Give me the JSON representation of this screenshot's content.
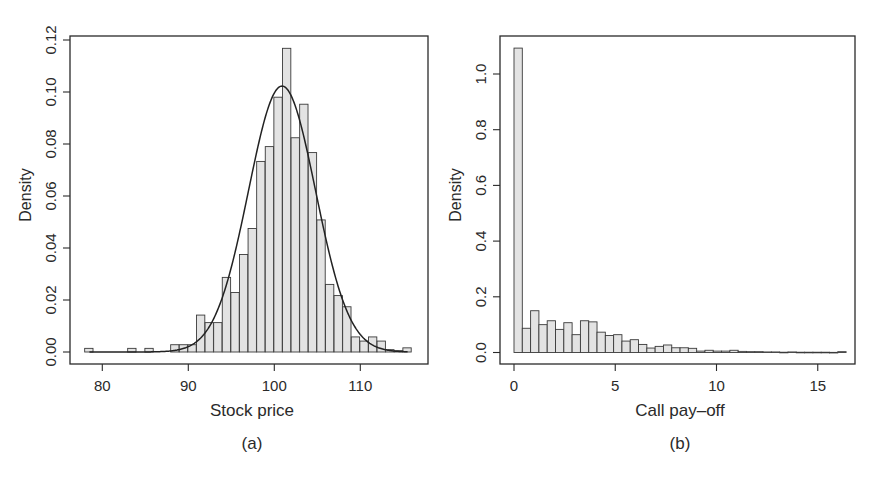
{
  "figure": {
    "panels": [
      {
        "id": "a",
        "caption": "(a)",
        "xlabel": "Stock price",
        "ylabel": "Density"
      },
      {
        "id": "b",
        "caption": "(b)",
        "xlabel": "Call pay–off",
        "ylabel": "Density"
      }
    ],
    "colors": {
      "bar_fill": "#e3e3e3",
      "bar_stroke": "#3a3a3a",
      "axis": "#2a2a2a",
      "curve": "#222222"
    }
  },
  "chart_data": [
    {
      "type": "bar",
      "subtype": "histogram_with_density_curve",
      "title": "",
      "caption": "(a)",
      "xlabel": "Stock price",
      "ylabel": "Density",
      "xlim": [
        76.5,
        117.3
      ],
      "ylim": [
        0,
        0.12
      ],
      "xticks": [
        80,
        90,
        100,
        110
      ],
      "yticks": [
        "0.00",
        "0.02",
        "0.04",
        "0.06",
        "0.08",
        "0.10",
        "0.12"
      ],
      "bin_width": 1,
      "bins_start": [
        78,
        83,
        85,
        88,
        89,
        90,
        91,
        92,
        93,
        94,
        95,
        96,
        97,
        98,
        99,
        100,
        101,
        102,
        103,
        104,
        105,
        106,
        107,
        108,
        109,
        110,
        111,
        112,
        113,
        114,
        115
      ],
      "values": [
        0.0014,
        0.0014,
        0.0014,
        0.0028,
        0.0028,
        0.0028,
        0.0142,
        0.0113,
        0.0113,
        0.0287,
        0.0229,
        0.0375,
        0.0475,
        0.0733,
        0.079,
        0.098,
        0.1168,
        0.0824,
        0.0953,
        0.0767,
        0.0508,
        0.026,
        0.0217,
        0.0174,
        0.0058,
        0.0042,
        0.0058,
        0.0042,
        0.0009,
        0.0005,
        0.0016
      ],
      "curve": {
        "type": "normal_density",
        "mean": 100.9,
        "sd": 3.9,
        "peak": 0.102
      },
      "grid": false,
      "legend": null
    },
    {
      "type": "bar",
      "subtype": "histogram",
      "title": "",
      "caption": "(b)",
      "xlabel": "Call pay–off",
      "ylabel": "Density",
      "xlim": [
        -0.7,
        16.9
      ],
      "ylim": [
        0,
        1.1
      ],
      "xticks": [
        0,
        5,
        10,
        15
      ],
      "yticks": [
        "0.0",
        "0.2",
        "0.4",
        "0.6",
        "0.8",
        "1.0"
      ],
      "bin_width": 0.41,
      "values": [
        1.093,
        0.087,
        0.15,
        0.1,
        0.114,
        0.083,
        0.107,
        0.064,
        0.114,
        0.11,
        0.073,
        0.061,
        0.064,
        0.041,
        0.046,
        0.029,
        0.016,
        0.022,
        0.027,
        0.017,
        0.017,
        0.015,
        0.005,
        0.008,
        0.005,
        0.005,
        0.008,
        0.004,
        0.003,
        0.003,
        0.002,
        0.002,
        0.001,
        0.002,
        0.001,
        0.001,
        0.001,
        0.001,
        0.0005,
        0.003
      ],
      "grid": false,
      "legend": null
    }
  ]
}
